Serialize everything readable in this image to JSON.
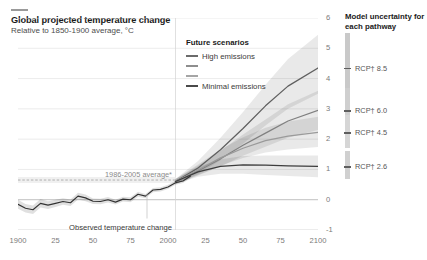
{
  "header": {
    "title": "Global projected temperature change",
    "subtitle": "Relative to 1850-1900 average, °C"
  },
  "legend": {
    "title": "Future scenarios",
    "items": [
      {
        "label": "High emissions",
        "color": "#6b6b6b"
      },
      {
        "label": "",
        "color": "#8e8e8e"
      },
      {
        "label": "",
        "color": "#a5a5a5"
      },
      {
        "label": "Minimal emissions",
        "color": "#4a4a4a"
      }
    ]
  },
  "right_panel": {
    "title": "Model uncertainty for each pathway",
    "pathways": [
      {
        "label": "RCP† 8.5",
        "color": "#c9c9c9"
      },
      {
        "label": "RCP† 6.0",
        "color": "#cfcfcf"
      },
      {
        "label": "RCP† 4.5",
        "color": "#d6d6d6"
      },
      {
        "label": "RCP† 2.6",
        "color": "#d0d0d0"
      }
    ]
  },
  "annotations": {
    "baseline": "1986-2005 average*",
    "observed": "Observed temperature change"
  },
  "chart_data": {
    "type": "line",
    "title": "Global projected temperature change",
    "subtitle": "Relative to 1850-1900 average, °C",
    "xlabel": "",
    "ylabel": "°C relative to 1850-1900 average",
    "xlim": [
      1900,
      2100
    ],
    "ylim": [
      -1,
      6
    ],
    "yticks": [
      -1,
      0,
      1,
      2,
      3,
      4,
      5,
      6
    ],
    "xticks": [
      1900,
      1925,
      1950,
      1975,
      2000,
      2025,
      2050,
      2075,
      2100
    ],
    "xticklabels": [
      "1900",
      "25",
      "50",
      "75",
      "2000",
      "25",
      "50",
      "75",
      "2100"
    ],
    "grid": "horizontal",
    "legend_position": "inside-top-center",
    "projection_start": 2005,
    "baseline_band": [
      0.55,
      0.75
    ],
    "series": [
      {
        "name": "Observed temperature change",
        "kind": "historical",
        "color": "#333333",
        "x": [
          1900,
          1905,
          1910,
          1915,
          1920,
          1925,
          1930,
          1935,
          1940,
          1945,
          1950,
          1955,
          1960,
          1965,
          1970,
          1975,
          1980,
          1985,
          1990,
          1995,
          2000,
          2005,
          2010,
          2015
        ],
        "y": [
          -0.15,
          -0.28,
          -0.33,
          -0.12,
          -0.18,
          -0.12,
          -0.06,
          -0.1,
          0.12,
          0.06,
          -0.05,
          -0.06,
          0.0,
          -0.08,
          0.02,
          0.0,
          0.18,
          0.12,
          0.32,
          0.34,
          0.42,
          0.56,
          0.62,
          0.78
        ],
        "band_lower": [
          -0.3,
          -0.42,
          -0.47,
          -0.26,
          -0.31,
          -0.24,
          -0.17,
          -0.21,
          0.01,
          -0.05,
          -0.14,
          -0.15,
          -0.09,
          -0.16,
          -0.06,
          -0.08,
          0.1,
          0.05,
          0.25,
          0.27,
          0.35,
          0.49,
          0.55,
          0.71
        ],
        "band_upper": [
          0.0,
          -0.14,
          -0.19,
          0.02,
          -0.05,
          0.0,
          0.05,
          0.01,
          0.23,
          0.17,
          0.04,
          0.03,
          0.09,
          0.0,
          0.1,
          0.08,
          0.26,
          0.19,
          0.39,
          0.41,
          0.49,
          0.63,
          0.69,
          0.85
        ]
      },
      {
        "name": "RCP† 8.5",
        "kind": "projection",
        "legend_label": "High emissions",
        "color": "#5f5f5f",
        "x": [
          2005,
          2020,
          2035,
          2050,
          2065,
          2080,
          2100
        ],
        "y": [
          0.6,
          1.05,
          1.65,
          2.35,
          3.1,
          3.75,
          4.35
        ],
        "band_lower": [
          0.52,
          0.85,
          1.3,
          1.85,
          2.45,
          3.0,
          3.5
        ],
        "band_upper": [
          0.68,
          1.28,
          2.05,
          2.9,
          3.8,
          4.65,
          5.45
        ],
        "end_value": 4.35
      },
      {
        "name": "RCP† 6.0",
        "kind": "projection",
        "color": "#808080",
        "x": [
          2005,
          2020,
          2035,
          2050,
          2065,
          2080,
          2100
        ],
        "y": [
          0.6,
          0.95,
          1.35,
          1.8,
          2.2,
          2.6,
          2.95
        ],
        "band_lower": [
          0.52,
          0.8,
          1.1,
          1.45,
          1.75,
          2.05,
          2.3
        ],
        "band_upper": [
          0.68,
          1.12,
          1.62,
          2.15,
          2.65,
          3.15,
          3.6
        ],
        "end_value": 2.95
      },
      {
        "name": "RCP† 4.5",
        "kind": "projection",
        "color": "#9a9a9a",
        "x": [
          2005,
          2020,
          2035,
          2050,
          2065,
          2080,
          2100
        ],
        "y": [
          0.6,
          0.98,
          1.38,
          1.7,
          1.95,
          2.1,
          2.22
        ],
        "band_lower": [
          0.52,
          0.82,
          1.12,
          1.38,
          1.56,
          1.66,
          1.74
        ],
        "band_upper": [
          0.68,
          1.16,
          1.66,
          2.06,
          2.38,
          2.58,
          2.74
        ],
        "end_value": 2.22
      },
      {
        "name": "RCP† 2.6",
        "kind": "projection",
        "legend_label": "Minimal emissions",
        "color": "#3d3d3d",
        "x": [
          2005,
          2020,
          2035,
          2050,
          2065,
          2080,
          2100
        ],
        "y": [
          0.6,
          0.92,
          1.1,
          1.15,
          1.14,
          1.12,
          1.1
        ],
        "band_lower": [
          0.52,
          0.76,
          0.86,
          0.86,
          0.82,
          0.78,
          0.74
        ],
        "band_upper": [
          0.68,
          1.08,
          1.34,
          1.44,
          1.46,
          1.46,
          1.46
        ],
        "end_value": 1.1
      }
    ],
    "uncertainty_markers": [
      {
        "label": "RCP† 8.5",
        "center": 4.35,
        "low": 3.3,
        "high": 5.5
      },
      {
        "label": "RCP† 6.0",
        "center": 2.95,
        "low": 2.2,
        "high": 3.7
      },
      {
        "label": "RCP† 4.5",
        "center": 2.22,
        "low": 1.7,
        "high": 2.8
      },
      {
        "label": "RCP† 2.6",
        "center": 1.1,
        "low": 0.7,
        "high": 1.6
      }
    ]
  }
}
